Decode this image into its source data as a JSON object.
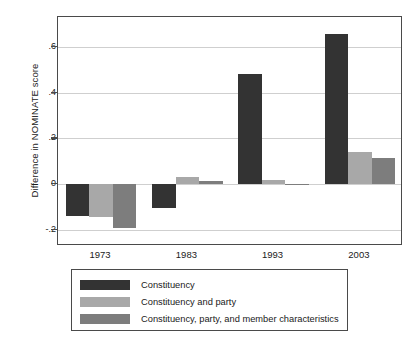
{
  "chart_data": {
    "type": "bar",
    "title": "",
    "subtitle": "",
    "xlabel": "",
    "ylabel": "Difference in NOMINATE score",
    "categories": [
      "1973",
      "1983",
      "1993",
      "2003"
    ],
    "ylim": [
      -0.27,
      0.73
    ],
    "yticks": [
      -0.2,
      0,
      0.2,
      0.4,
      0.6
    ],
    "ytick_labels": [
      "-.2",
      "0",
      ".2",
      ".4",
      ".6"
    ],
    "grid": true,
    "legend_position": "below",
    "series": [
      {
        "name": "Constituency",
        "color": "#333333",
        "values": [
          -0.14,
          -0.105,
          0.48,
          0.655
        ]
      },
      {
        "name": "Constituency and party",
        "color": "#a8a8a8",
        "values": [
          -0.145,
          0.03,
          0.02,
          0.14
        ]
      },
      {
        "name": "Constituency, party, and member characteristics",
        "color": "#7d7d7d",
        "values": [
          -0.19,
          0.015,
          -0.004,
          0.115
        ]
      }
    ]
  },
  "axes": {
    "frame_color": "#4a4a4a",
    "grid_color": "#cfcfcf"
  }
}
